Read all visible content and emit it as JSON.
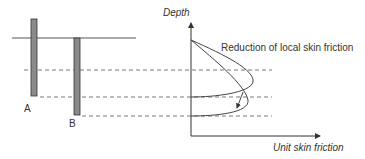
{
  "diagram": {
    "piles": [
      {
        "label": "A"
      },
      {
        "label": "B"
      }
    ],
    "graph": {
      "y_axis_label": "Depth",
      "x_axis_label": "Unit skin friction",
      "annotation": "Reduction of local skin friction"
    },
    "colors": {
      "line": "#444444",
      "pile_fill": "#8a8a8a",
      "text": "#333333",
      "background": "#ffffff"
    }
  }
}
